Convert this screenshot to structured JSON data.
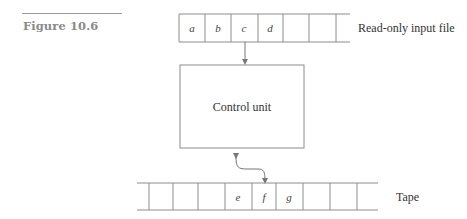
{
  "figure": {
    "label": "Figure 10.6"
  },
  "input_file": {
    "label": "Read-only input file",
    "cells": [
      "a",
      "b",
      "c",
      "d",
      "",
      "",
      ""
    ]
  },
  "control_unit": {
    "label": "Control unit"
  },
  "tape": {
    "label": "Tape",
    "cells": [
      "",
      "",
      "",
      "",
      "e",
      "f",
      "g",
      "",
      "",
      ""
    ]
  },
  "colors": {
    "line": "#8c8c8c",
    "text": "#333333",
    "figure_label": "#8a8a8a"
  }
}
